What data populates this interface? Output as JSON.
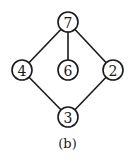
{
  "diagram": {
    "caption": "(b)",
    "nodes": [
      {
        "id": "7",
        "label": "7",
        "x": 68,
        "y": 22
      },
      {
        "id": "4",
        "label": "4",
        "x": 22,
        "y": 70
      },
      {
        "id": "6",
        "label": "6",
        "x": 68,
        "y": 70
      },
      {
        "id": "2",
        "label": "2",
        "x": 113,
        "y": 70
      },
      {
        "id": "3",
        "label": "3",
        "x": 68,
        "y": 117
      }
    ],
    "edges": [
      [
        "7",
        "4"
      ],
      [
        "7",
        "6"
      ],
      [
        "7",
        "2"
      ],
      [
        "4",
        "3"
      ],
      [
        "2",
        "3"
      ]
    ]
  }
}
